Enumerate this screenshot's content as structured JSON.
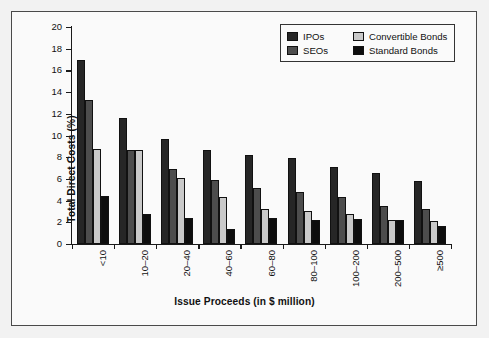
{
  "chart_data": {
    "type": "bar",
    "title": "",
    "xlabel": "Issue Proceeds (in $ million)",
    "ylabel": "Total Direct Costs (%)",
    "ylim": [
      0,
      20
    ],
    "yticks": [
      0,
      2,
      4,
      6,
      8,
      10,
      12,
      14,
      16,
      18,
      20
    ],
    "ytick_labels": [
      "0",
      "2",
      "4",
      "6",
      "8",
      "10",
      "12",
      "14",
      "16",
      "18",
      "20"
    ],
    "grid": false,
    "legend_position": "top-right",
    "categories": [
      "<10",
      "10–20",
      "20–40",
      "40–60",
      "60–80",
      "80–100",
      "100–200",
      "200–500",
      "≥500"
    ],
    "series": [
      {
        "name": "IPOs",
        "color": "#262626",
        "values": [
          17.0,
          11.6,
          9.7,
          8.7,
          8.2,
          7.95,
          7.1,
          6.55,
          5.8
        ]
      },
      {
        "name": "SEOs",
        "color": "#4d4d4d",
        "values": [
          13.3,
          8.7,
          6.9,
          5.9,
          5.2,
          4.75,
          4.3,
          3.5,
          3.2
        ]
      },
      {
        "name": "Convertible Bonds",
        "color": "#c9c9c9",
        "values": [
          8.75,
          8.65,
          6.1,
          4.3,
          3.2,
          3.05,
          2.8,
          2.2,
          2.1
        ]
      },
      {
        "name": "Standard Bonds",
        "color": "#0d0d0d",
        "values": [
          4.4,
          2.8,
          2.4,
          1.4,
          2.4,
          2.2,
          2.35,
          2.25,
          1.7
        ]
      }
    ]
  },
  "legend": {
    "items": [
      {
        "label": "IPOs",
        "swatch": "legend-swatch-ipos"
      },
      {
        "label": "Convertible Bonds",
        "swatch": "legend-swatch-convertible-bonds"
      },
      {
        "label": "SEOs",
        "swatch": "legend-swatch-seos"
      },
      {
        "label": "Standard Bonds",
        "swatch": "legend-swatch-standard-bonds"
      }
    ]
  },
  "figure": {
    "background": "#f2f2f2",
    "plot_background": "#fafafa",
    "frame_color": "#4a4a4a",
    "axis_color": "#1a1a1a"
  }
}
